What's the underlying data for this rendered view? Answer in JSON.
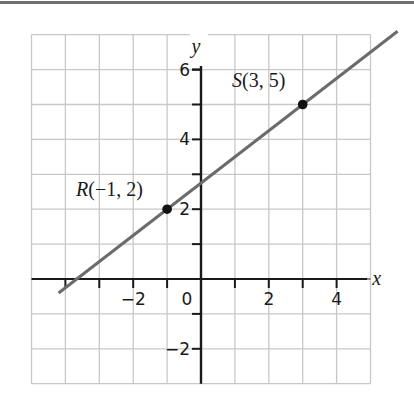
{
  "chart_data": {
    "type": "line",
    "title": "",
    "xlabel": "x",
    "ylabel": "y",
    "xlim": [
      -5,
      5
    ],
    "ylim": [
      -3,
      7
    ],
    "grid": true,
    "x_ticks": [
      -4,
      -3,
      -2,
      -1,
      1,
      2,
      3,
      4
    ],
    "y_ticks": [
      -2,
      -1,
      1,
      2,
      3,
      4,
      5,
      6
    ],
    "x_tick_labels": [
      {
        "value": -2,
        "label": "−2"
      },
      {
        "value": 0,
        "label": "0"
      },
      {
        "value": 2,
        "label": "2"
      },
      {
        "value": 4,
        "label": "4"
      }
    ],
    "y_tick_labels": [
      {
        "value": 6,
        "label": "6"
      },
      {
        "value": 4,
        "label": "4"
      },
      {
        "value": 2,
        "label": "2"
      },
      {
        "value": -2,
        "label": "−2"
      }
    ],
    "points": [
      {
        "name": "R",
        "x": -1,
        "y": 2,
        "label_name": "R",
        "label_coords": "(−1, 2)"
      },
      {
        "name": "S",
        "x": 3,
        "y": 5,
        "label_name": "S",
        "label_coords": "(3, 5)"
      }
    ],
    "series": [
      {
        "name": "line RS",
        "slope": 0.75,
        "intercept": 2.75,
        "x": [
          -4.2,
          5.8
        ],
        "y": [
          -0.4,
          7.1
        ]
      }
    ],
    "colors": {
      "line": "#6b6b6b",
      "grid": "#c8c8c8",
      "axis": "#1a1a1a",
      "point": "#111111"
    }
  }
}
